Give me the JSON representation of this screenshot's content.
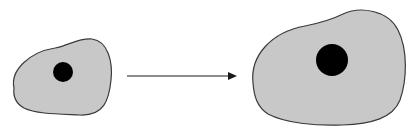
{
  "diagram": {
    "type": "cell-growth",
    "colors": {
      "background": "#ffffff",
      "cytoplasm_fill": "#c8c8c8",
      "cell_outline": "#3a3a3a",
      "nucleus": "#000000",
      "arrow": "#1a1a1a"
    },
    "nodes": [
      {
        "id": "small-cell",
        "label": "",
        "nucleus_radius": 10
      },
      {
        "id": "large-cell",
        "label": "",
        "nucleus_radius": 16
      }
    ],
    "edges": [
      {
        "from": "small-cell",
        "to": "large-cell",
        "style": "arrow",
        "label": ""
      }
    ]
  }
}
